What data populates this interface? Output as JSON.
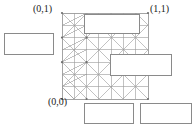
{
  "figure": {
    "type": "triangular-finite-element-mesh",
    "domain_shape": "unit-square",
    "line_color": "#9a9a9a",
    "node_color": "#6e6e6e",
    "callout_border_color": "#8a8a8a",
    "callout_fill_color": "#ffffff",
    "background_color": "#ffffff"
  },
  "labels": {
    "top_left": "(0,1)",
    "top_right": "(1,1)",
    "bottom_left": "(0,0)"
  },
  "callouts": [
    {
      "name": "left-callout",
      "text": ""
    },
    {
      "name": "top-callout",
      "text": ""
    },
    {
      "name": "middle-right-callout",
      "text": ""
    },
    {
      "name": "bottom-left-callout",
      "text": ""
    },
    {
      "name": "bottom-right-callout",
      "text": ""
    }
  ],
  "mesh": {
    "x0": 62,
    "y0": 13,
    "x1": 148,
    "y1": 99,
    "cols": 7,
    "rows": 7
  }
}
